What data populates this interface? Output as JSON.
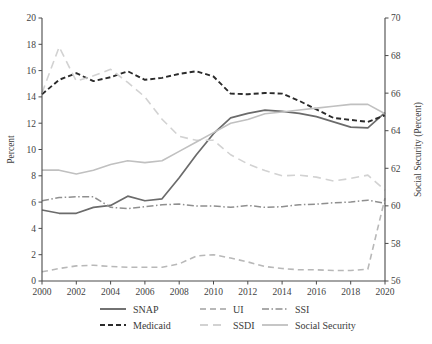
{
  "chart_data": {
    "type": "line",
    "title": "",
    "xlabel": "",
    "ylabel": "Percent",
    "y2label": "Social Security (Percent)",
    "x": [
      2000,
      2001,
      2002,
      2003,
      2004,
      2005,
      2006,
      2007,
      2008,
      2009,
      2010,
      2011,
      2012,
      2013,
      2014,
      2015,
      2016,
      2017,
      2018,
      2019,
      2020
    ],
    "xlim": [
      2000,
      2020
    ],
    "xticks": [
      2000,
      2002,
      2004,
      2006,
      2008,
      2010,
      2012,
      2014,
      2016,
      2018,
      2020
    ],
    "xtick_labels": [
      "2000",
      "2002",
      "2004",
      "2006",
      "2008",
      "2010",
      "2012",
      "2014",
      "2016",
      "2018",
      "2020"
    ],
    "ylim": [
      0,
      20
    ],
    "yticks": [
      0,
      2,
      4,
      6,
      8,
      10,
      12,
      14,
      16,
      18,
      20
    ],
    "ytick_labels": [
      "0",
      "2",
      "4",
      "6",
      "8",
      "10",
      "12",
      "14",
      "16",
      "18",
      "20"
    ],
    "y2lim": [
      56,
      70
    ],
    "y2ticks": [
      56,
      58,
      60,
      62,
      64,
      66,
      68,
      70
    ],
    "y2tick_labels": [
      "56",
      "58",
      "60",
      "62",
      "64",
      "66",
      "68",
      "70"
    ],
    "grid": false,
    "legend_position": "bottom",
    "series": [
      {
        "name": "SNAP",
        "axis": "left",
        "color": "#6b6b6b",
        "dash": "none",
        "width": 1.7,
        "values": [
          5.4,
          5.15,
          5.15,
          5.6,
          5.75,
          6.45,
          6.1,
          6.25,
          7.85,
          9.6,
          11.2,
          12.4,
          12.75,
          13.0,
          12.9,
          12.75,
          12.5,
          12.1,
          11.7,
          11.65,
          12.8
        ]
      },
      {
        "name": "Medicaid",
        "axis": "left",
        "color": "#2b2b2b",
        "dash": "5,3",
        "width": 1.9,
        "values": [
          14.2,
          15.3,
          15.8,
          15.2,
          15.5,
          15.95,
          15.3,
          15.45,
          15.75,
          15.95,
          15.55,
          14.25,
          14.2,
          14.3,
          14.25,
          13.7,
          13.05,
          12.4,
          12.25,
          12.1,
          12.6
        ]
      },
      {
        "name": "UI",
        "axis": "left",
        "color": "#b8b8b8",
        "dash": "6,4",
        "width": 1.6,
        "values": [
          0.7,
          0.95,
          1.15,
          1.2,
          1.1,
          1.05,
          1.05,
          1.05,
          1.3,
          1.9,
          2.0,
          1.75,
          1.45,
          1.1,
          0.95,
          0.85,
          0.85,
          0.8,
          0.8,
          0.9,
          6.3
        ]
      },
      {
        "name": "SSDI",
        "axis": "left",
        "color": "#d2d2d2",
        "dash": "8,5",
        "width": 1.6,
        "values": [
          14.3,
          17.8,
          15.2,
          15.6,
          16.1,
          15.1,
          14.0,
          12.3,
          11.0,
          10.7,
          10.7,
          9.6,
          8.9,
          8.4,
          8.0,
          8.05,
          7.9,
          7.6,
          7.8,
          8.05,
          6.9
        ]
      },
      {
        "name": "SSI",
        "axis": "left",
        "color": "#8f8f8f",
        "dash": "7,2.5,1.5,2.5",
        "width": 1.5,
        "values": [
          6.1,
          6.35,
          6.4,
          6.4,
          5.6,
          5.5,
          5.65,
          5.8,
          5.85,
          5.7,
          5.7,
          5.6,
          5.75,
          5.6,
          5.65,
          5.8,
          5.85,
          5.95,
          6.0,
          6.15,
          5.9
        ]
      },
      {
        "name": "Social Security",
        "axis": "right",
        "color": "#c0c0c0",
        "dash": "none",
        "width": 1.6,
        "values": [
          61.9,
          61.9,
          61.7,
          61.9,
          62.2,
          62.4,
          62.3,
          62.4,
          62.9,
          63.4,
          63.9,
          64.4,
          64.6,
          64.9,
          65.0,
          65.1,
          65.2,
          65.3,
          65.4,
          65.4,
          64.9
        ]
      }
    ],
    "legend": [
      {
        "label": "SNAP",
        "color": "#6b6b6b",
        "dash": "none",
        "width": 1.9
      },
      {
        "label": "UI",
        "color": "#b8b8b8",
        "dash": "6,4",
        "width": 1.8
      },
      {
        "label": "SSI",
        "color": "#8f8f8f",
        "dash": "7,2.5,1.5,2.5",
        "width": 1.7
      },
      {
        "label": "Medicaid",
        "color": "#2b2b2b",
        "dash": "5,3",
        "width": 2.1
      },
      {
        "label": "SSDI",
        "color": "#d2d2d2",
        "dash": "8,5",
        "width": 1.8
      },
      {
        "label": "Social Security",
        "color": "#c0c0c0",
        "dash": "none",
        "width": 1.8
      }
    ]
  }
}
